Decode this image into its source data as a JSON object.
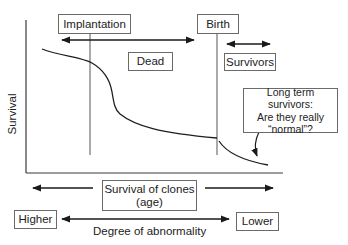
{
  "axes": {
    "y_label": "Survival"
  },
  "stages": {
    "implantation": "Implantation",
    "birth": "Birth",
    "dead": "Dead",
    "survivors": "Survivors"
  },
  "callout": {
    "line1": "Long term survivors:",
    "line2": "Are they really",
    "line3": "“normal”?"
  },
  "x_axis_caption": {
    "line1": "Survival of clones",
    "line2": "(age)"
  },
  "abnormality_scale": {
    "left": "Higher",
    "right": "Lower",
    "caption": "Degree of abnormality"
  },
  "colors": {
    "line": "#2a2a2a",
    "box_border": "#6a6a6a",
    "text": "#222222"
  }
}
